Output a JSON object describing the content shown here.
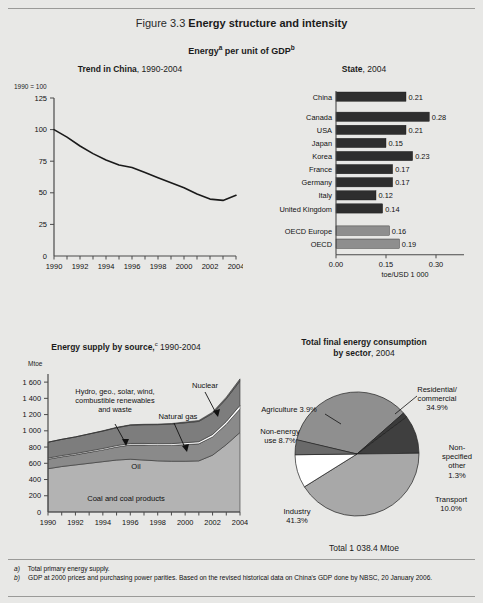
{
  "figure": {
    "number": "Figure 3.3",
    "title": "Energy structure and intensity",
    "subtitle": "Energy per unit of GDP",
    "subtitle_sup_a": "a",
    "subtitle_sup_b": "b"
  },
  "footnotes": [
    {
      "marker": "a)",
      "text": "Total primary energy supply."
    },
    {
      "marker": "b)",
      "text": "GDP at 2000 prices and purchasing power parities. Based on the revised historical data on China's GDP done by NBSC, 20 January 2006."
    }
  ],
  "panels": {
    "trend": {
      "title_bold": "Trend in China",
      "title_rest": ", 1990-2004",
      "axis_note": "1990 = 100",
      "ytitle": "",
      "yticks": [
        "125",
        "100",
        "75",
        "50",
        "25",
        "0"
      ],
      "xticks": [
        "1990",
        "1992",
        "1994",
        "1996",
        "1998",
        "2000",
        "2002",
        "2004"
      ]
    },
    "state": {
      "title_bold": "State",
      "title_rest": ", 2004",
      "xaxis_label": "toe/USD 1 000",
      "xticks": [
        "0.00",
        "0.15",
        "0.30"
      ]
    },
    "supply": {
      "title_bold": "Energy supply by source,",
      "title_sup": "c",
      "title_rest": " 1990-2004",
      "unit": "Mtoe",
      "yticks": [
        "1 600",
        "1 400",
        "1 200",
        "1 000",
        "800",
        "600",
        "400",
        "200",
        "0"
      ],
      "xticks": [
        "1990",
        "1992",
        "1994",
        "1996",
        "1998",
        "2000",
        "2002",
        "2004"
      ],
      "annotations": {
        "renewables": "Hydro, geo., solar, wind,\ncombustible renewables\nand waste",
        "nuclear": "Nuclear",
        "natural_gas": "Natural gas",
        "oil": "Oil",
        "coal": "Coal and coal products"
      }
    },
    "consumption": {
      "title_line1": "Total final energy consumption",
      "title_bold": "by sector",
      "title_rest": ", 2004",
      "total": "Total 1 038.4 Mtoe"
    }
  },
  "chart_data": [
    {
      "type": "line",
      "title": "Trend in China, 1990-2004",
      "xlabel": "",
      "ylabel": "1990 = 100",
      "xlim": [
        1990,
        2004
      ],
      "ylim": [
        0,
        125
      ],
      "grid": false,
      "x": [
        1990,
        1991,
        1992,
        1993,
        1994,
        1995,
        1996,
        1997,
        1998,
        1999,
        2000,
        2001,
        2002,
        2003,
        2004
      ],
      "values": [
        100,
        94,
        87,
        81,
        76,
        72,
        70,
        66,
        62,
        58,
        54,
        49,
        45,
        44,
        48
      ],
      "series_name": "Energy per unit of GDP, index"
    },
    {
      "type": "bar",
      "orientation": "horizontal",
      "title": "State, 2004",
      "xlabel": "toe/USD 1 000",
      "ylabel": "",
      "xlim": [
        0,
        0.33
      ],
      "xticks": [
        0.0,
        0.15,
        0.3
      ],
      "grid": false,
      "categories": [
        "China",
        "Canada",
        "USA",
        "Japan",
        "Korea",
        "France",
        "Germany",
        "Italy",
        "United Kingdom",
        "OECD Europe",
        "OECD"
      ],
      "values": [
        0.21,
        0.28,
        0.21,
        0.15,
        0.23,
        0.17,
        0.17,
        0.12,
        0.14,
        0.16,
        0.19
      ],
      "value_labels": [
        "0.21",
        "0.28",
        "0.21",
        "0.15",
        "0.23",
        "0.17",
        "0.17",
        "0.12",
        "0.14",
        "0.16",
        "0.19"
      ],
      "group_colors": [
        "#2e2e2e",
        "#2e2e2e",
        "#2e2e2e",
        "#2e2e2e",
        "#2e2e2e",
        "#2e2e2e",
        "#2e2e2e",
        "#2e2e2e",
        "#2e2e2e",
        "#8e8e8e",
        "#8e8e8e"
      ]
    },
    {
      "type": "area",
      "stacked": true,
      "title": "Energy supply by source, 1990-2004",
      "xlabel": "",
      "ylabel": "Mtoe",
      "ylim": [
        0,
        1700
      ],
      "xlim": [
        1990,
        2004
      ],
      "grid": false,
      "x": [
        1990,
        1991,
        1992,
        1993,
        1994,
        1995,
        1996,
        1997,
        1998,
        1999,
        2000,
        2001,
        2002,
        2003,
        2004
      ],
      "series": [
        {
          "name": "Coal and coal products",
          "color": "#b3b3b3",
          "values": [
            533,
            560,
            580,
            600,
            620,
            640,
            650,
            640,
            630,
            625,
            625,
            630,
            700,
            830,
            980
          ]
        },
        {
          "name": "Oil",
          "color": "#8a8a8a",
          "values": [
            117,
            120,
            125,
            135,
            145,
            160,
            175,
            185,
            190,
            195,
            205,
            210,
            225,
            250,
            290
          ]
        },
        {
          "name": "Natural gas",
          "color": "#ffffff",
          "values": [
            14,
            15,
            15,
            16,
            17,
            18,
            19,
            20,
            21,
            22,
            24,
            26,
            30,
            35,
            45
          ]
        },
        {
          "name": "Hydro, geo., solar, wind, combustible renewables and waste",
          "color": "#7d7d7d",
          "values": [
            196,
            200,
            205,
            210,
            215,
            220,
            225,
            230,
            235,
            240,
            245,
            250,
            260,
            280,
            300
          ]
        },
        {
          "name": "Nuclear",
          "color": "#6e6e6e",
          "values": [
            0,
            0,
            0,
            2,
            4,
            5,
            5,
            6,
            7,
            8,
            10,
            12,
            15,
            20,
            25
          ]
        }
      ],
      "annotation_labels": [
        "Hydro, geo., solar, wind, combustible renewables and waste",
        "Nuclear",
        "Natural gas",
        "Oil",
        "Coal and coal products"
      ]
    },
    {
      "type": "pie",
      "title": "Total final energy consumption by sector, 2004",
      "total_label": "Total 1 038.4 Mtoe",
      "labels": [
        "Residential/commercial",
        "Non-specified other",
        "Transport",
        "Industry",
        "Non-energy use",
        "Agriculture"
      ],
      "values": [
        34.9,
        1.3,
        10.0,
        41.3,
        8.7,
        3.9
      ],
      "value_labels": [
        "34.9%",
        "1.3%",
        "10.0%",
        "41.3%",
        "8.7%",
        "3.9%"
      ],
      "colors": [
        "#8f8f8f",
        "#3a3a3a",
        "#3f3f3f",
        "#a8a8a8",
        "#ffffff",
        "#6a6a6a"
      ],
      "units": "percent"
    }
  ],
  "colors": {
    "page_bg": "#e8e8e6",
    "bar_dark": "#2e2e2e",
    "bar_grey": "#8e8e8e",
    "axis": "#4a4a4a",
    "line": "#1a1a1a"
  }
}
